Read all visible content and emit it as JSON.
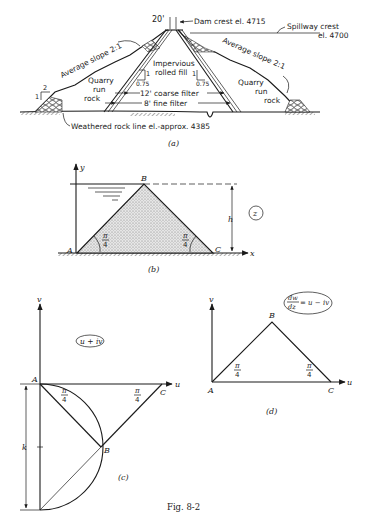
{
  "figure": {
    "caption": "Fig. 8-2",
    "panels": {
      "a": {
        "label": "(a)",
        "crest_width": "20'",
        "dam_crest": "Dam crest el. 4715",
        "spillway_crest_line1": "Spillway crest",
        "spillway_crest_line2": "el. 4700",
        "left_slope": "Average slope 2:1",
        "right_slope": "Average slope 2:1",
        "left_fill_line1": "Quarry",
        "left_fill_line2": "run",
        "left_fill_line3": "rock",
        "right_fill_line1": "Quarry",
        "right_fill_line2": "run",
        "right_fill_line3": "rock",
        "core_line1": "Impervious",
        "core_line2": "rolled fill",
        "core_slope_v": "1",
        "core_slope_h": "0.75",
        "toe_slope_v": "1",
        "toe_slope_h": "2",
        "coarse_filter": "12' coarse filter",
        "fine_filter": "8' fine filter",
        "rock_line": "Weathered rock line el.-approx. 4385"
      },
      "b": {
        "label": "(b)",
        "plane": "z",
        "axis_x": "x",
        "axis_y": "y",
        "point_a": "A",
        "point_b": "B",
        "point_c": "C",
        "height": "h",
        "angle_num": "π",
        "angle_den": "4"
      },
      "c": {
        "label": "(c)",
        "plane": "u + iv",
        "axis_u": "u",
        "axis_v": "v",
        "point_a": "A",
        "point_b": "B",
        "point_c": "C",
        "dimension": "k",
        "angle_num": "π",
        "angle_den": "4"
      },
      "d": {
        "label": "(d)",
        "plane_lhs_num": "dw",
        "plane_lhs_den": "dz",
        "plane_rhs": "= u − iv",
        "axis_u": "u",
        "axis_v": "v",
        "point_a": "A",
        "point_b": "B",
        "point_c": "C",
        "angle_num": "π",
        "angle_den": "4"
      }
    }
  }
}
